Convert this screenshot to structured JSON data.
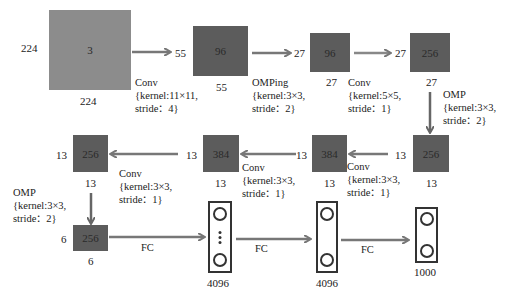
{
  "diagram": {
    "type": "CNN architecture (AlexNet-style)",
    "colors": {
      "input_map": "#8c8c8c",
      "feature_map": "#5c5c5c",
      "arrow": "#777777",
      "fc_border": "#333333"
    },
    "input": {
      "depth": "3",
      "height": "224",
      "width": "224"
    },
    "layers": [
      {
        "depth": "96",
        "height": "55",
        "width": "55"
      },
      {
        "depth": "96",
        "height": "27",
        "width": "27"
      },
      {
        "depth": "256",
        "height": "27",
        "width": "27"
      },
      {
        "depth": "256",
        "height": "13",
        "width": "13"
      },
      {
        "depth": "384",
        "height": "13",
        "width": "13"
      },
      {
        "depth": "384",
        "height": "13",
        "width": "13"
      },
      {
        "depth": "256",
        "height": "13",
        "width": "13"
      },
      {
        "depth": "256",
        "height": "6",
        "width": "6"
      }
    ],
    "ops": [
      {
        "name": "Conv",
        "kernel": "{kernel:11×11,",
        "stride": "stride：4}"
      },
      {
        "name": "OMPing",
        "kernel": "{kernel:3×3,",
        "stride": "stride：2}"
      },
      {
        "name": "Conv",
        "kernel": "{kernel:5×5,",
        "stride": "stride：1}"
      },
      {
        "name": "OMP",
        "kernel": "{kernel:3×3,",
        "stride": "stride：2}"
      },
      {
        "name": "Conv",
        "kernel": "{kernel:3×3,",
        "stride": "stride：1}"
      },
      {
        "name": "Conv",
        "kernel": "{kernel:3×3,",
        "stride": "stride：1}"
      },
      {
        "name": "Conv",
        "kernel": "{kernel:3×3,",
        "stride": "stride：1}"
      },
      {
        "name": "OMP",
        "kernel": "{kernel:3×3,",
        "stride": "stride：2}"
      }
    ],
    "fc_layers": [
      {
        "label": "FC",
        "units": "4096"
      },
      {
        "label": "FC",
        "units": "4096"
      },
      {
        "label": "FC",
        "units": "1000"
      }
    ]
  }
}
